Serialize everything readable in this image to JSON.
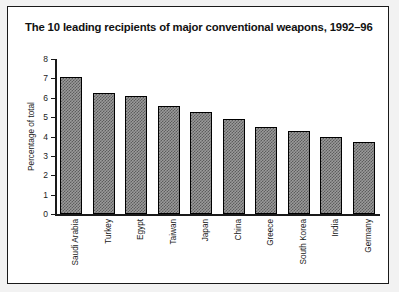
{
  "figure": {
    "title": "The 10 leading recipients of major conventional weapons, 1992–96"
  },
  "chart_data": {
    "type": "bar",
    "title": "The 10 leading recipients of major conventional weapons, 1992–96",
    "xlabel": "",
    "ylabel": "Percentage of total",
    "categories": [
      "Saudi Arabia",
      "Turkey",
      "Egypt",
      "Taiwan",
      "Japan",
      "China",
      "Greece",
      "South Korea",
      "India",
      "Germany"
    ],
    "values": [
      7.05,
      6.25,
      6.1,
      5.6,
      5.25,
      4.9,
      4.5,
      4.3,
      4.0,
      3.7
    ],
    "ylim": [
      0,
      8
    ],
    "yticks": [
      0,
      1,
      2,
      3,
      4,
      5,
      6,
      7,
      8
    ],
    "ytick_labels": [
      "0",
      "1",
      "2",
      "3",
      "4",
      "5",
      "6",
      "7",
      "8"
    ],
    "grid": false,
    "legend": false,
    "bar_fill": "#9a9a9a",
    "bar_pattern": "checkerboard-dither",
    "bar_edge_color": "#000000",
    "axis_color": "#1a1a1a"
  }
}
